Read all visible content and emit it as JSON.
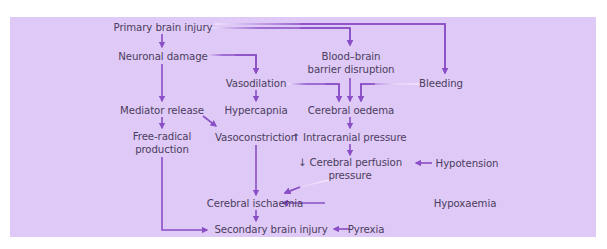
{
  "diagram": {
    "colors": {
      "background": "#dfc9f6",
      "arrow": "#8a4fc6",
      "text": "#4b3d60"
    },
    "nodes": {
      "primary_brain_injury": {
        "lines": [
          "Primary brain injury"
        ]
      },
      "neuronal_damage": {
        "lines": [
          "Neuronal damage"
        ]
      },
      "bbb_disruption": {
        "lines": [
          "Blood–brain",
          "barrier disruption"
        ]
      },
      "vasodilation": {
        "lines": [
          "Vasodilation"
        ]
      },
      "bleeding": {
        "lines": [
          "Bleeding"
        ]
      },
      "mediator_release": {
        "lines": [
          "Mediator release"
        ]
      },
      "hypercapnia": {
        "lines": [
          "Hypercapnia"
        ]
      },
      "cerebral_oedema": {
        "lines": [
          "Cerebral oedema"
        ]
      },
      "free_radical_production": {
        "lines": [
          "Free-radical",
          "production"
        ]
      },
      "vasoconstriction": {
        "lines": [
          "Vasoconstriction"
        ]
      },
      "intracranial_pressure": {
        "lines": [
          "↑ Intracranial pressure"
        ]
      },
      "cerebral_perfusion_pressure": {
        "lines": [
          "↓ Cerebral perfusion",
          "pressure"
        ]
      },
      "hypotension": {
        "lines": [
          "Hypotension"
        ]
      },
      "cerebral_ischaemia": {
        "lines": [
          "Cerebral ischaemia"
        ]
      },
      "hypoxaemia": {
        "lines": [
          "Hypoxaemia"
        ]
      },
      "secondary_brain_injury": {
        "lines": [
          "Secondary brain injury"
        ]
      },
      "pyrexia": {
        "lines": [
          "Pyrexia"
        ]
      }
    },
    "edges": [
      {
        "from": "primary_brain_injury",
        "to": "neuronal_damage"
      },
      {
        "from": "primary_brain_injury",
        "to": "bbb_disruption"
      },
      {
        "from": "primary_brain_injury",
        "to": "bleeding"
      },
      {
        "from": "neuronal_damage",
        "to": "vasodilation"
      },
      {
        "from": "neuronal_damage",
        "to": "mediator_release"
      },
      {
        "from": "vasodilation",
        "to": "hypercapnia"
      },
      {
        "from": "vasodilation",
        "to": "cerebral_oedema"
      },
      {
        "from": "bbb_disruption",
        "to": "cerebral_oedema"
      },
      {
        "from": "bleeding",
        "to": "cerebral_oedema"
      },
      {
        "from": "mediator_release",
        "to": "free_radical_production"
      },
      {
        "from": "mediator_release",
        "to": "vasoconstriction"
      },
      {
        "from": "cerebral_oedema",
        "to": "intracranial_pressure"
      },
      {
        "from": "intracranial_pressure",
        "to": "cerebral_perfusion_pressure"
      },
      {
        "from": "hypotension",
        "to": "cerebral_perfusion_pressure"
      },
      {
        "from": "cerebral_perfusion_pressure",
        "to": "cerebral_ischaemia"
      },
      {
        "from": "vasoconstriction",
        "to": "cerebral_ischaemia"
      },
      {
        "from": "hypoxaemia",
        "to": "cerebral_ischaemia"
      },
      {
        "from": "cerebral_ischaemia",
        "to": "secondary_brain_injury"
      },
      {
        "from": "free_radical_production",
        "to": "secondary_brain_injury"
      },
      {
        "from": "pyrexia",
        "to": "secondary_brain_injury"
      }
    ]
  }
}
